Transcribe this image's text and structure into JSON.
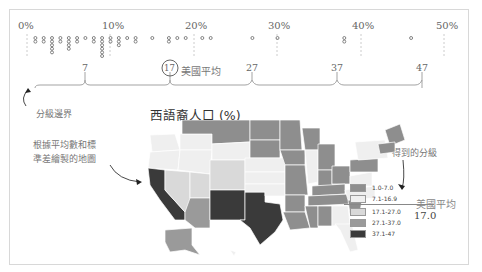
{
  "chart_data": {
    "type": "dot-strip + choropleth",
    "title": "西語裔人口 (%)",
    "axis": {
      "ticks": [
        "0%",
        "10%",
        "20%",
        "30%",
        "40%",
        "50%"
      ],
      "range": [
        0,
        50
      ]
    },
    "dot_values_percent": [
      1,
      1,
      2,
      2,
      3,
      3,
      3,
      3,
      3,
      4,
      4,
      5,
      5,
      5,
      5,
      6,
      6,
      7,
      8,
      8,
      9,
      9,
      9,
      9,
      9,
      9,
      10,
      10,
      11,
      11,
      11,
      12,
      13,
      13,
      15,
      17,
      17,
      18,
      19,
      21,
      22,
      27,
      30,
      38,
      38,
      46
    ],
    "class_breaks": [
      7,
      17,
      27,
      37,
      47
    ],
    "us_average": 17,
    "legend": [
      {
        "label": "1.0-7.0",
        "color": "#8e8e8e"
      },
      {
        "label": "7.1-16.9",
        "color": "#f0f0f0"
      },
      {
        "label": "17.1-27.0",
        "color": "#d9d9d9"
      },
      {
        "label": "27.1-37.0",
        "color": "#9a9a9a"
      },
      {
        "label": "37.1-47",
        "color": "#3a3a3a"
      }
    ]
  },
  "annotations": {
    "us_average_label": "美國平均",
    "average_circle_value": "17",
    "class_boundary": "分級邊界",
    "map_method": "根據平均數和標準差繪製的地圖",
    "map_method_line1": "根據平均數和標",
    "map_method_line2": "準差繪製的地圖",
    "resulting_classes": "得到的分級",
    "us_average_value": "17.0"
  },
  "breaks_labels": [
    "7",
    "17",
    "27",
    "37",
    "47"
  ]
}
